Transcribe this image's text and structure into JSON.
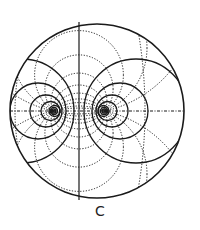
{
  "figure": {
    "caption": "C",
    "colors": {
      "ink": "#1a1a1a",
      "background": "#ffffff"
    },
    "outer_circle": {
      "cx": 97,
      "cy": 111,
      "r": 87
    },
    "foci": [
      {
        "name": "left",
        "x": 53,
        "y": 111
      },
      {
        "name": "right",
        "x": 105,
        "y": 111
      }
    ],
    "axes": {
      "vertical_x": 79,
      "horizontal_y": 111
    }
  }
}
